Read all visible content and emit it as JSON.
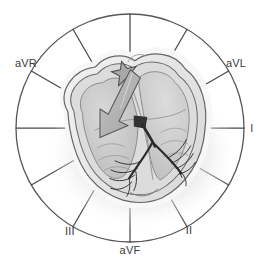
{
  "figure": {
    "background_color": "#ffffff",
    "line_color": "#4a4a4a",
    "text_color": "#3a3a3a"
  },
  "axis_circle": {
    "center_x": 130,
    "center_y": 128,
    "radius": 114,
    "stroke_color": "#555555",
    "stroke_width": 1.3,
    "spoke_count": 12,
    "spoke_spacing_degrees": 30
  },
  "leads": [
    {
      "name": "lead-aVR",
      "label": "aVR",
      "degrees": -150,
      "label_x": 26,
      "label_y": 67
    },
    {
      "name": "lead-aVL",
      "label": "aVL",
      "degrees": -30,
      "label_x": 236,
      "label_y": 67
    },
    {
      "name": "lead-I",
      "label": "I",
      "degrees": 0,
      "label_x": 252,
      "label_y": 132
    },
    {
      "name": "lead-II",
      "label": "II",
      "degrees": 60,
      "label_x": 189,
      "label_y": 234
    },
    {
      "name": "lead-aVF",
      "label": "aVF",
      "degrees": 90,
      "label_x": 130,
      "label_y": 254
    },
    {
      "name": "lead-III",
      "label": "III",
      "degrees": 120,
      "label_x": 70,
      "label_y": 235
    }
  ],
  "heart": {
    "label": "Heart cross-section",
    "outer_halo_color": "#f2f2f2",
    "epicardium_color": "#e9e9e9",
    "myocardium_color": "#d2d2d2",
    "chamber_color": "#c6c6c6",
    "endocardium_color": "#f6f6f6",
    "shadow_color": "#e4e4e4",
    "outline_color": "#555555"
  },
  "conduction_system": {
    "sa_node": {
      "label": "SA node",
      "shape": "star",
      "fill": "#a8a8a8",
      "stroke": "#4a4a4a",
      "cx": 132,
      "cy": 71
    },
    "av_node": {
      "label": "AV node",
      "fill": "#3a3a3a"
    },
    "bundle_of_his": {
      "label": "Bundle of His",
      "stroke": "#2b2b2b"
    },
    "left_bundle_branch": {
      "label": "Left bundle branch",
      "stroke": "#2b2b2b"
    },
    "right_bundle_branch": {
      "label": "Right bundle branch",
      "stroke": "#2b2b2b"
    },
    "purkinje_fibers": {
      "label": "Purkinje fibers",
      "stroke": "#2b2b2b"
    }
  },
  "depolarization_vector": {
    "label": "Depolarization vector arrow",
    "fill": "#b0b0b0",
    "stroke": "#5a5a5a",
    "tail_x": 140,
    "tail_y": 76,
    "head_x": 102,
    "head_y": 126,
    "direction_degrees": 233
  }
}
